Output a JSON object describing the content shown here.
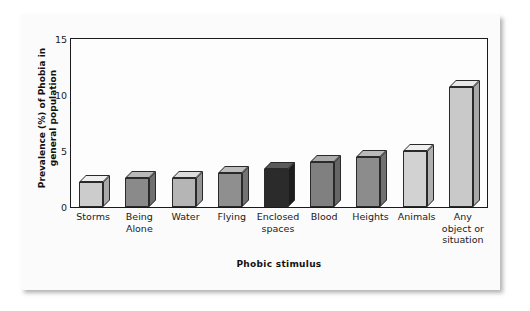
{
  "chart_data": {
    "type": "bar",
    "title": "",
    "xlabel": "Phobic stimulus",
    "ylabel": "Prevalence (%) of Phobia in general population",
    "ylim": [
      0,
      15
    ],
    "yticks": [
      0,
      5,
      10,
      15
    ],
    "grid": false,
    "legend": null,
    "categories": [
      "Storms",
      "Being Alone",
      "Water",
      "Flying",
      "Enclosed spaces",
      "Blood",
      "Heights",
      "Animals",
      "Any object or situation"
    ],
    "category_lines": [
      [
        "Storms"
      ],
      [
        "Being",
        "Alone"
      ],
      [
        "Water"
      ],
      [
        "Flying"
      ],
      [
        "Enclosed",
        "spaces"
      ],
      [
        "Blood"
      ],
      [
        "Heights"
      ],
      [
        "Animals"
      ],
      [
        "Any",
        "object or",
        "situation"
      ]
    ],
    "values": [
      2.2,
      2.6,
      2.6,
      3.0,
      3.4,
      4.0,
      4.5,
      5.0,
      10.7
    ],
    "bar_colors": [
      "#cccccc",
      "#8a8a8a",
      "#b5b5b5",
      "#8f8f8f",
      "#2b2b2b",
      "#808080",
      "#8c8c8c",
      "#d2d2d2",
      "#c9c9c9"
    ],
    "bar_top_colors": [
      "#f0f0f0",
      "#b9b9b9",
      "#dcdcdc",
      "#bdbdbd",
      "#5a5a5a",
      "#ababab",
      "#bababa",
      "#efefef",
      "#e8e8e8"
    ],
    "bar_side_colors": [
      "#a9a9a9",
      "#6f6f6f",
      "#959595",
      "#737373",
      "#1d1d1d",
      "#666666",
      "#717171",
      "#b0b0b0",
      "#a8a8a8"
    ]
  },
  "style": {
    "page_background": "#ffffff",
    "card_background": "#fbfbfb",
    "plot_background": "#fdfdfd",
    "axis_color": "#1a1a1a",
    "text_color": "#1a1a1a"
  }
}
